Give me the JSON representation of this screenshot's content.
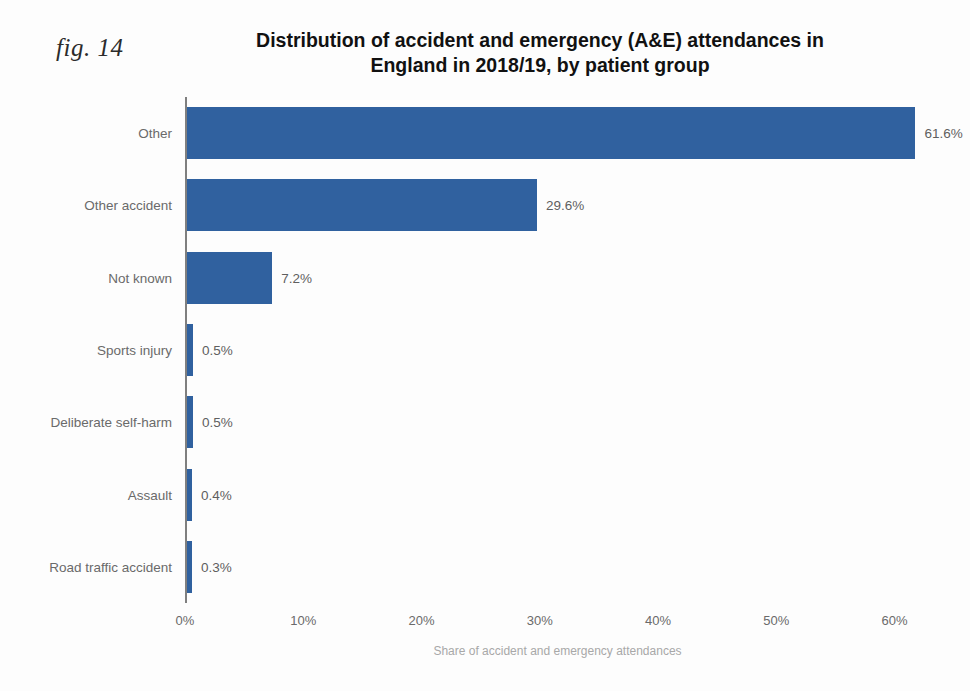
{
  "figure": {
    "fig_label": "fig. 14",
    "title_line1": "Distribution of accident and emergency (A&E) attendances in",
    "title_line2": "England in 2018/19, by patient group"
  },
  "chart_data": {
    "type": "bar",
    "orientation": "horizontal",
    "title": "Distribution of accident and emergency (A&E) attendances in England in 2018/19, by patient group",
    "xlabel": "Share of accident and emergency attendances",
    "ylabel": "",
    "categories": [
      "Other",
      "Other accident",
      "Not known",
      "Sports injury",
      "Deliberate self-harm",
      "Assault",
      "Road traffic accident"
    ],
    "values": [
      61.6,
      29.6,
      7.2,
      0.5,
      0.5,
      0.4,
      0.3
    ],
    "data_labels": [
      "61.6%",
      "29.6%",
      "7.2%",
      "0.5%",
      "0.5%",
      "0.4%",
      "0.3%"
    ],
    "xlim": [
      0,
      63
    ],
    "xticks": [
      0,
      10,
      20,
      30,
      40,
      50,
      60
    ],
    "xtick_labels": [
      "0%",
      "10%",
      "20%",
      "30%",
      "40%",
      "50%",
      "60%"
    ],
    "grid": false,
    "legend": null,
    "bar_color": "#30619f",
    "axis_color": "#7f7f7f",
    "label_color": "#6a6a6a",
    "background": "#fdfdfd"
  }
}
